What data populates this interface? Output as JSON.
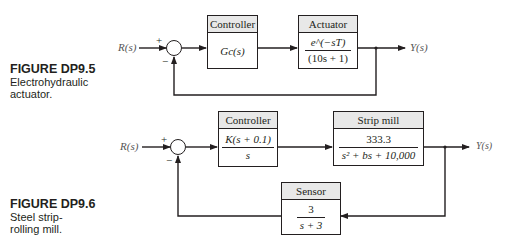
{
  "figure_dp9_5": {
    "caption_title": "FIGURE DP9.5",
    "caption_line1": "Electrohydraulic",
    "caption_line2": "actuator.",
    "input_label": "R(s)",
    "output_label": "Y(s)",
    "sum_plus": "+",
    "sum_minus": "−",
    "controller": {
      "header": "Controller",
      "tf": "Gc(s)"
    },
    "actuator": {
      "header": "Actuator",
      "numerator": "e^(−sT)",
      "denominator": "(10s + 1)"
    }
  },
  "figure_dp9_6": {
    "caption_title": "FIGURE DP9.6",
    "caption_line1": "Steel strip-",
    "caption_line2": "rolling mill.",
    "input_label": "R(s)",
    "output_label": "Y(s)",
    "sum_plus": "+",
    "sum_minus": "−",
    "controller": {
      "header": "Controller",
      "numerator": "K(s + 0.1)",
      "denominator": "s"
    },
    "strip_mill": {
      "header": "Strip mill",
      "numerator": "333.3",
      "denominator": "s² + bs + 10,000"
    },
    "sensor": {
      "header": "Sensor",
      "numerator": "3",
      "denominator": "s + 3"
    }
  }
}
